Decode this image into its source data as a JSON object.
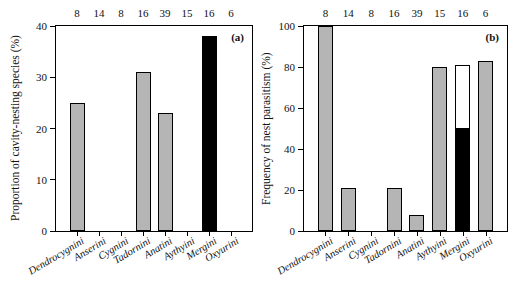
{
  "colors": {
    "bar_gray": "#b5b5b5",
    "bar_black": "#000000",
    "bar_white": "#ffffff",
    "axis": "#000000"
  },
  "chart_data": [
    {
      "type": "bar",
      "panel_label": "(a)",
      "title": "",
      "xlabel": "",
      "ylabel": "Proportion of cavity-nesting species (%)",
      "ylim": [
        0,
        40
      ],
      "yticks": [
        0,
        10,
        20,
        30,
        40
      ],
      "grid": false,
      "legend": false,
      "categories": [
        "Dendrocygnini",
        "Anserini",
        "Cygnini",
        "Tadornini",
        "Anatini",
        "Aythyini",
        "Mergini",
        "Oxyurini"
      ],
      "sample_sizes": [
        8,
        14,
        8,
        16,
        39,
        15,
        16,
        6
      ],
      "values": [
        25,
        0,
        0,
        31,
        23,
        0,
        38,
        0
      ],
      "bars": [
        [
          {
            "value": 25,
            "color": "gray"
          }
        ],
        [],
        [],
        [
          {
            "value": 31,
            "color": "gray"
          }
        ],
        [
          {
            "value": 23,
            "color": "gray"
          }
        ],
        [],
        [
          {
            "value": 38,
            "color": "black"
          }
        ],
        []
      ]
    },
    {
      "type": "stacked-bar",
      "panel_label": "(b)",
      "title": "",
      "xlabel": "",
      "ylabel": "Frequency of nest parasitism (%)",
      "ylim": [
        0,
        100
      ],
      "yticks": [
        0,
        20,
        40,
        60,
        80,
        100
      ],
      "grid": false,
      "legend": false,
      "categories": [
        "Dendrocygnini",
        "Anserini",
        "Cygnini",
        "Tadornini",
        "Anatini",
        "Aythyini",
        "Mergini",
        "Oxyurini"
      ],
      "sample_sizes": [
        8,
        14,
        8,
        16,
        39,
        15,
        16,
        6
      ],
      "values": [
        100,
        21,
        0,
        21,
        8,
        80,
        81,
        83
      ],
      "bars": [
        [
          {
            "value": 100,
            "color": "gray"
          }
        ],
        [
          {
            "value": 21,
            "color": "gray"
          }
        ],
        [],
        [
          {
            "value": 21,
            "color": "gray"
          }
        ],
        [
          {
            "value": 8,
            "color": "gray"
          }
        ],
        [
          {
            "value": 80,
            "color": "gray"
          }
        ],
        [
          {
            "value": 50,
            "color": "black"
          },
          {
            "value": 31,
            "color": "white"
          }
        ],
        [
          {
            "value": 83,
            "color": "gray"
          }
        ]
      ]
    }
  ]
}
